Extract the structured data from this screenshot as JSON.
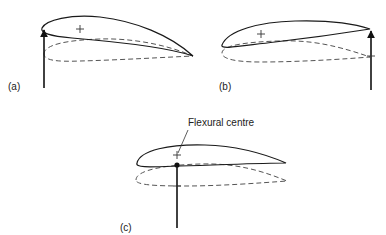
{
  "figure": {
    "panels": [
      {
        "id": "a",
        "label": "(a)",
        "description": "Force applied at leading edge; section twists about flexural axis"
      },
      {
        "id": "b",
        "label": "(b)",
        "description": "Force applied at trailing edge; section twists opposite way"
      },
      {
        "id": "c",
        "label": "(c)",
        "description": "Force applied at flexural centre; pure bending, no twist",
        "annotation": "Flexural centre"
      }
    ],
    "legend_semantics": {
      "solid_outline": "deflected aerofoil section",
      "dashed_outline": "original aerofoil section position",
      "plus_marker": "flexural centre",
      "arrow": "applied load"
    },
    "colors": {
      "line": "#1a1a1a",
      "dashed": "#555555",
      "background": "#ffffff"
    }
  }
}
